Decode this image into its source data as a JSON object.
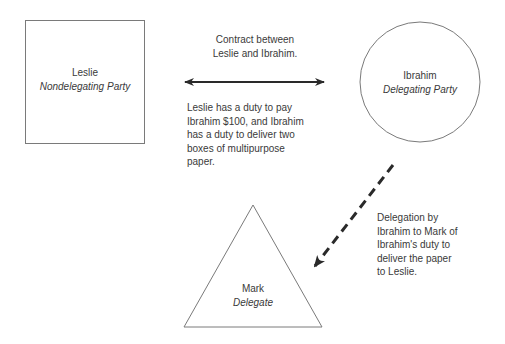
{
  "nodes": {
    "leslie": {
      "name": "Leslie",
      "role": "Nondelegating Party",
      "shape": "square"
    },
    "ibrahim": {
      "name": "Ibrahim",
      "role": "Delegating Party",
      "shape": "circle"
    },
    "mark": {
      "name": "Mark",
      "role": "Delegate",
      "shape": "triangle"
    }
  },
  "edges": {
    "contract": {
      "from": "leslie",
      "to": "ibrahim",
      "style": "solid-double-arrow",
      "title_lines": [
        "Contract between",
        "Leslie and Ibrahim."
      ],
      "desc_lines": [
        "Leslie has a duty to pay",
        "Ibrahim $100, and Ibrahim",
        "has a duty to deliver two",
        "boxes of multipurpose",
        "paper."
      ]
    },
    "delegation": {
      "from": "ibrahim",
      "to": "mark",
      "style": "dashed-arrow",
      "desc_lines": [
        "Delegation by",
        "Ibrahim to Mark of",
        "Ibrahim's duty to",
        "deliver the paper",
        "to Leslie."
      ]
    }
  },
  "colors": {
    "stroke": "#7a7a7a",
    "arrow": "#2a2a2a",
    "text": "#3a3a3a",
    "background": "#ffffff"
  }
}
